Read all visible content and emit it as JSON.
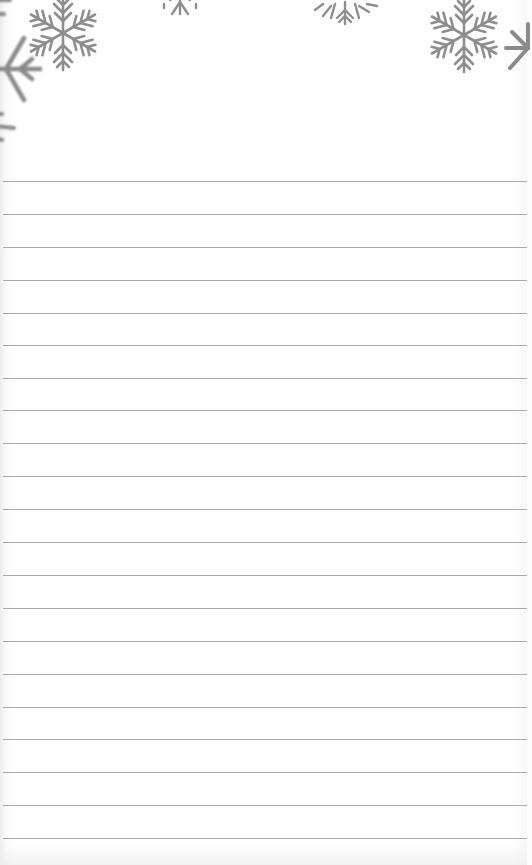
{
  "notepad": {
    "theme": "snowflake-lined-paper",
    "colors": {
      "paper": "#ffffff",
      "rule_line": "#9a9a9a",
      "snowflake": "#8e8e8e"
    },
    "ruled_lines": {
      "count": 21,
      "first_y": 181,
      "spacing": 32.85
    },
    "decorations": [
      {
        "name": "snowflake-top-left",
        "x": 63,
        "y": 33,
        "size": 80
      },
      {
        "name": "snowflake-left-edge-partial",
        "x": 5,
        "y": 68,
        "size": 70
      },
      {
        "name": "snowflake-left-edge-lower-partial",
        "x": -10,
        "y": 125,
        "size": 40
      },
      {
        "name": "snowflake-top-center-left-partial",
        "x": 180,
        "y": -10,
        "size": 40
      },
      {
        "name": "snowflake-top-center-right-partial",
        "x": 344,
        "y": -8,
        "size": 50
      },
      {
        "name": "snowflake-top-right",
        "x": 464,
        "y": 35,
        "size": 80
      },
      {
        "name": "snowflake-right-edge-partial",
        "x": 527,
        "y": 48,
        "size": 50
      }
    ]
  }
}
